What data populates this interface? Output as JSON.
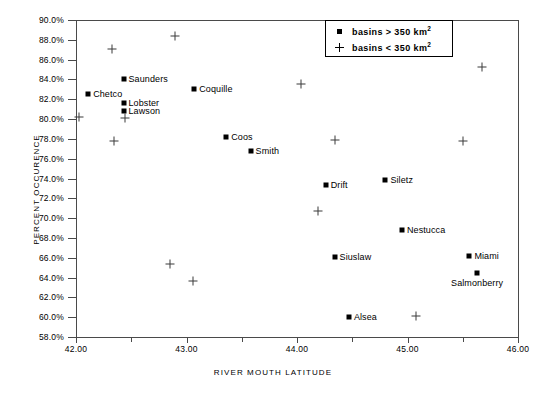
{
  "chart_data": {
    "type": "scatter",
    "title": "",
    "xlabel": "RIVER MOUTH LATITUDE",
    "ylabel": "PERCENT OCCURENCE",
    "xlim": [
      42.0,
      46.0
    ],
    "ylim": [
      58.0,
      90.0
    ],
    "grid": false,
    "xticks": [
      "42.00",
      "43.00",
      "44.00",
      "45.00",
      "46.00"
    ],
    "xtick_values": [
      42.0,
      43.0,
      44.0,
      45.0,
      46.0
    ],
    "xminor_values": [
      42.5,
      43.5,
      44.5,
      45.5
    ],
    "yticks": [
      "58.0%",
      "60.0%",
      "62.0%",
      "64.0%",
      "66.0%",
      "68.0%",
      "70.0%",
      "72.0%",
      "74.0%",
      "76.0%",
      "78.0%",
      "80.0%",
      "82.0%",
      "84.0%",
      "86.0%",
      "88.0%",
      "90.0%"
    ],
    "ytick_values": [
      58,
      60,
      62,
      64,
      66,
      68,
      70,
      72,
      74,
      76,
      78,
      80,
      82,
      84,
      86,
      88,
      90
    ],
    "legend": {
      "position": "top-right-inside",
      "entries": [
        {
          "marker": "square",
          "label": "basins > 350 km",
          "exponent": "2"
        },
        {
          "marker": "plus",
          "label": "basins < 350 km",
          "exponent": "2"
        }
      ]
    },
    "series": [
      {
        "name": "basins > 350 km2",
        "marker": "square",
        "points": [
          {
            "label": "Chetco",
            "x": 42.11,
            "y": 82.5,
            "label_pos": "right"
          },
          {
            "label": "Saunders",
            "x": 42.43,
            "y": 84.0,
            "label_pos": "right"
          },
          {
            "label": "Lobster",
            "x": 42.43,
            "y": 81.6,
            "label_pos": "right"
          },
          {
            "label": "Lawson",
            "x": 42.43,
            "y": 80.8,
            "label_pos": "right"
          },
          {
            "label": "Coquille",
            "x": 43.07,
            "y": 83.0,
            "label_pos": "right"
          },
          {
            "label": "Coos",
            "x": 43.36,
            "y": 78.2,
            "label_pos": "right"
          },
          {
            "label": "Smith",
            "x": 43.58,
            "y": 76.8,
            "label_pos": "right"
          },
          {
            "label": "Drift",
            "x": 44.26,
            "y": 73.3,
            "label_pos": "right"
          },
          {
            "label": "Siletz",
            "x": 44.8,
            "y": 73.8,
            "label_pos": "right"
          },
          {
            "label": "Nestucca",
            "x": 44.95,
            "y": 68.8,
            "label_pos": "right"
          },
          {
            "label": "Siuslaw",
            "x": 44.34,
            "y": 66.1,
            "label_pos": "right"
          },
          {
            "label": "Miami",
            "x": 45.56,
            "y": 66.2,
            "label_pos": "right"
          },
          {
            "label": "Salmonberry",
            "x": 45.63,
            "y": 64.5,
            "label_pos": "below"
          },
          {
            "label": "Alsea",
            "x": 44.47,
            "y": 60.0,
            "label_pos": "right"
          }
        ]
      },
      {
        "name": "basins < 350 km2",
        "marker": "plus",
        "points": [
          {
            "x": 42.33,
            "y": 87.1
          },
          {
            "x": 42.9,
            "y": 88.4
          },
          {
            "x": 42.03,
            "y": 80.2
          },
          {
            "x": 42.44,
            "y": 80.1
          },
          {
            "x": 44.04,
            "y": 83.5
          },
          {
            "x": 45.67,
            "y": 85.3
          },
          {
            "x": 42.34,
            "y": 77.8
          },
          {
            "x": 44.34,
            "y": 77.9
          },
          {
            "x": 45.5,
            "y": 77.8
          },
          {
            "x": 44.19,
            "y": 70.7
          },
          {
            "x": 42.85,
            "y": 65.4
          },
          {
            "x": 43.06,
            "y": 63.7
          },
          {
            "x": 45.08,
            "y": 60.1
          }
        ]
      }
    ]
  }
}
